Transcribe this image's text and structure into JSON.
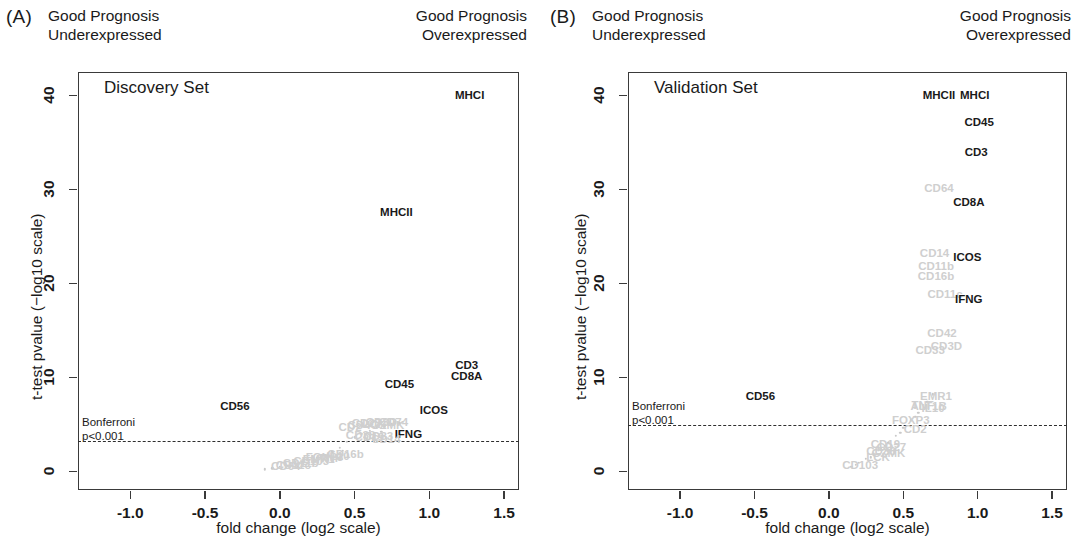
{
  "figure": {
    "axis_x_title": "fold change (log2 scale)",
    "axis_y_title": "t-test pvalue (−log10 scale)",
    "header_left": "Good Prognosis\nUnderexpressed",
    "header_right": "Good Prognosis\nOverexpressed",
    "bonferroni_line1": "Bonferroni",
    "bonferroni_line2": "p<0.001",
    "xticks": [
      "-1.0",
      "-0.5",
      "0.0",
      "0.5",
      "1.0",
      "1.5"
    ],
    "yticks": [
      "0",
      "10",
      "20",
      "30",
      "40"
    ]
  },
  "panels": [
    {
      "letter": "(A)",
      "set_name": "Discovery Set"
    },
    {
      "letter": "(B)",
      "set_name": "Validation Set"
    }
  ],
  "chart_data": [
    {
      "type": "scatter",
      "title": "Discovery Set",
      "panel": "(A)",
      "xlabel": "fold change (log2 scale)",
      "ylabel": "t-test pvalue (−log10 scale)",
      "xlim": [
        -1.35,
        1.6
      ],
      "ylim": [
        -2.0,
        42.5
      ],
      "xticks": [
        -1.0,
        -0.5,
        0.0,
        0.5,
        1.0,
        1.5
      ],
      "yticks": [
        0,
        10,
        20,
        30,
        40
      ],
      "grid": false,
      "legend": "none",
      "threshold_line": {
        "label": "Bonferroni p<0.001",
        "y": 3.2,
        "style": "dashed"
      },
      "labeled_points": [
        {
          "label": "MHCI",
          "x": 1.27,
          "y": 40.0,
          "emphasis": "dark"
        },
        {
          "label": "MHCII",
          "x": 0.78,
          "y": 27.6,
          "emphasis": "dark"
        },
        {
          "label": "CD3",
          "x": 1.25,
          "y": 11.3,
          "emphasis": "dark"
        },
        {
          "label": "CD8A",
          "x": 1.25,
          "y": 10.1,
          "emphasis": "dark"
        },
        {
          "label": "CD45",
          "x": 0.8,
          "y": 9.3,
          "emphasis": "dark"
        },
        {
          "label": "ICOS",
          "x": 1.03,
          "y": 6.5,
          "emphasis": "dark"
        },
        {
          "label": "CD56",
          "x": -0.3,
          "y": 6.9,
          "emphasis": "dark"
        },
        {
          "label": "IFNG",
          "x": 0.86,
          "y": 4.0,
          "emphasis": "dark"
        },
        {
          "label": "CD2",
          "x": 0.47,
          "y": 4.7,
          "emphasis": "faint"
        },
        {
          "label": "CD4",
          "x": 0.53,
          "y": 4.9,
          "emphasis": "faint"
        },
        {
          "label": "CD27",
          "x": 0.58,
          "y": 5.1,
          "emphasis": "faint"
        },
        {
          "label": "LCK",
          "x": 0.63,
          "y": 5.0,
          "emphasis": "faint"
        },
        {
          "label": "CD3D",
          "x": 0.68,
          "y": 5.2,
          "emphasis": "faint"
        },
        {
          "label": "GZMK",
          "x": 0.72,
          "y": 4.9,
          "emphasis": "faint"
        },
        {
          "label": "CD74",
          "x": 0.76,
          "y": 5.2,
          "emphasis": "faint"
        },
        {
          "label": "CD38",
          "x": 0.54,
          "y": 3.9,
          "emphasis": "faint"
        },
        {
          "label": "CD19",
          "x": 0.6,
          "y": 3.6,
          "emphasis": "faint"
        },
        {
          "label": "CD33",
          "x": 0.66,
          "y": 3.7,
          "emphasis": "faint"
        },
        {
          "label": "CD14",
          "x": 0.71,
          "y": 3.4,
          "emphasis": "faint"
        },
        {
          "label": "FOXP3",
          "x": 0.3,
          "y": 1.5,
          "emphasis": "faint"
        },
        {
          "label": "CD103",
          "x": 0.21,
          "y": 1.1,
          "emphasis": "faint"
        },
        {
          "label": "EMR1",
          "x": 0.26,
          "y": 1.3,
          "emphasis": "faint"
        },
        {
          "label": "TNF",
          "x": 0.34,
          "y": 1.4,
          "emphasis": "faint"
        },
        {
          "label": "IL10",
          "x": 0.39,
          "y": 1.6,
          "emphasis": "faint"
        },
        {
          "label": "CD16b",
          "x": 0.44,
          "y": 1.8,
          "emphasis": "faint"
        },
        {
          "label": "CD11b",
          "x": 0.14,
          "y": 0.9,
          "emphasis": "faint"
        },
        {
          "label": "CD11c",
          "x": 0.09,
          "y": 0.7,
          "emphasis": "faint"
        },
        {
          "label": "CD64",
          "x": 0.04,
          "y": 0.6,
          "emphasis": "faint"
        }
      ],
      "cloud_points": [
        {
          "x": -0.05,
          "y": 0.3
        },
        {
          "x": 0.0,
          "y": 0.5
        },
        {
          "x": 0.05,
          "y": 0.6
        },
        {
          "x": 0.1,
          "y": 0.8
        },
        {
          "x": 0.15,
          "y": 1.0
        },
        {
          "x": 0.2,
          "y": 1.2
        },
        {
          "x": 0.25,
          "y": 1.4
        },
        {
          "x": 0.3,
          "y": 1.7
        },
        {
          "x": 0.35,
          "y": 2.0
        },
        {
          "x": 0.4,
          "y": 2.5
        },
        {
          "x": 0.45,
          "y": 3.1
        },
        {
          "x": 0.5,
          "y": 3.6
        },
        {
          "x": 0.55,
          "y": 4.0
        },
        {
          "x": 0.6,
          "y": 4.3
        },
        {
          "x": 0.65,
          "y": 4.6
        },
        {
          "x": 0.7,
          "y": 4.8
        },
        {
          "x": 0.75,
          "y": 5.0
        },
        {
          "x": 0.8,
          "y": 5.1
        },
        {
          "x": -0.1,
          "y": 0.2
        },
        {
          "x": 0.12,
          "y": 0.5
        },
        {
          "x": 0.28,
          "y": 1.1
        },
        {
          "x": 0.42,
          "y": 2.2
        },
        {
          "x": 0.58,
          "y": 3.4
        },
        {
          "x": 0.68,
          "y": 4.2
        }
      ]
    },
    {
      "type": "scatter",
      "title": "Validation Set",
      "panel": "(B)",
      "xlabel": "fold change (log2 scale)",
      "ylabel": "t-test pvalue (−log10 scale)",
      "xlim": [
        -1.35,
        1.6
      ],
      "ylim": [
        -2.0,
        42.5
      ],
      "xticks": [
        -1.0,
        -0.5,
        0.0,
        0.5,
        1.0,
        1.5
      ],
      "yticks": [
        0,
        10,
        20,
        30,
        40
      ],
      "grid": false,
      "legend": "none",
      "threshold_line": {
        "label": "Bonferroni p<0.001",
        "y": 4.9,
        "style": "dashed"
      },
      "labeled_points": [
        {
          "label": "MHCII",
          "x": 0.74,
          "y": 40.1,
          "emphasis": "dark"
        },
        {
          "label": "MHCI",
          "x": 0.98,
          "y": 40.1,
          "emphasis": "dark"
        },
        {
          "label": "CD45",
          "x": 1.01,
          "y": 37.2,
          "emphasis": "dark"
        },
        {
          "label": "CD3",
          "x": 0.99,
          "y": 34.0,
          "emphasis": "dark"
        },
        {
          "label": "CD64",
          "x": 0.74,
          "y": 30.1,
          "emphasis": "faint"
        },
        {
          "label": "CD8A",
          "x": 0.94,
          "y": 28.7,
          "emphasis": "dark"
        },
        {
          "label": "CD14",
          "x": 0.71,
          "y": 23.2,
          "emphasis": "faint"
        },
        {
          "label": "ICOS",
          "x": 0.93,
          "y": 22.8,
          "emphasis": "dark"
        },
        {
          "label": "CD11b",
          "x": 0.72,
          "y": 21.9,
          "emphasis": "faint"
        },
        {
          "label": "CD16b",
          "x": 0.72,
          "y": 20.8,
          "emphasis": "faint"
        },
        {
          "label": "CD11c",
          "x": 0.78,
          "y": 18.9,
          "emphasis": "faint"
        },
        {
          "label": "IFNG",
          "x": 0.94,
          "y": 18.3,
          "emphasis": "dark"
        },
        {
          "label": "CD42",
          "x": 0.76,
          "y": 14.7,
          "emphasis": "faint"
        },
        {
          "label": "CD3D",
          "x": 0.79,
          "y": 13.3,
          "emphasis": "faint"
        },
        {
          "label": "CD33",
          "x": 0.68,
          "y": 12.9,
          "emphasis": "faint"
        },
        {
          "label": "CD56",
          "x": -0.46,
          "y": 8.0,
          "emphasis": "dark"
        },
        {
          "label": "EMR1",
          "x": 0.72,
          "y": 8.0,
          "emphasis": "faint"
        },
        {
          "label": "TNF",
          "x": 0.63,
          "y": 7.0,
          "emphasis": "faint"
        },
        {
          "label": "IL10",
          "x": 0.7,
          "y": 6.7,
          "emphasis": "faint"
        },
        {
          "label": "ALT1B",
          "x": 0.67,
          "y": 6.9,
          "emphasis": "faint"
        },
        {
          "label": "FOXP3",
          "x": 0.55,
          "y": 5.5,
          "emphasis": "faint"
        },
        {
          "label": "CD2",
          "x": 0.58,
          "y": 4.5,
          "emphasis": "faint"
        },
        {
          "label": "CD19",
          "x": 0.38,
          "y": 2.9,
          "emphasis": "faint"
        },
        {
          "label": "CD27",
          "x": 0.42,
          "y": 2.6,
          "emphasis": "faint"
        },
        {
          "label": "CD38",
          "x": 0.35,
          "y": 2.2,
          "emphasis": "faint"
        },
        {
          "label": "GZMK",
          "x": 0.4,
          "y": 1.9,
          "emphasis": "faint"
        },
        {
          "label": "CD103",
          "x": 0.21,
          "y": 0.7,
          "emphasis": "faint"
        },
        {
          "label": "LCK",
          "x": 0.33,
          "y": 1.5,
          "emphasis": "faint"
        }
      ],
      "cloud_points": [
        {
          "x": 0.15,
          "y": 0.5
        },
        {
          "x": 0.2,
          "y": 0.9
        },
        {
          "x": 0.25,
          "y": 1.3
        },
        {
          "x": 0.3,
          "y": 1.8
        },
        {
          "x": 0.35,
          "y": 2.4
        },
        {
          "x": 0.4,
          "y": 3.0
        },
        {
          "x": 0.45,
          "y": 3.8
        },
        {
          "x": 0.5,
          "y": 4.6
        },
        {
          "x": 0.55,
          "y": 5.4
        },
        {
          "x": 0.6,
          "y": 6.2
        },
        {
          "x": 0.65,
          "y": 7.0
        },
        {
          "x": 0.7,
          "y": 8.2
        },
        {
          "x": 0.18,
          "y": 0.7
        },
        {
          "x": 0.28,
          "y": 1.5
        },
        {
          "x": 0.38,
          "y": 2.7
        },
        {
          "x": 0.48,
          "y": 4.1
        },
        {
          "x": 0.58,
          "y": 5.8
        },
        {
          "x": 0.66,
          "y": 7.4
        }
      ]
    }
  ]
}
